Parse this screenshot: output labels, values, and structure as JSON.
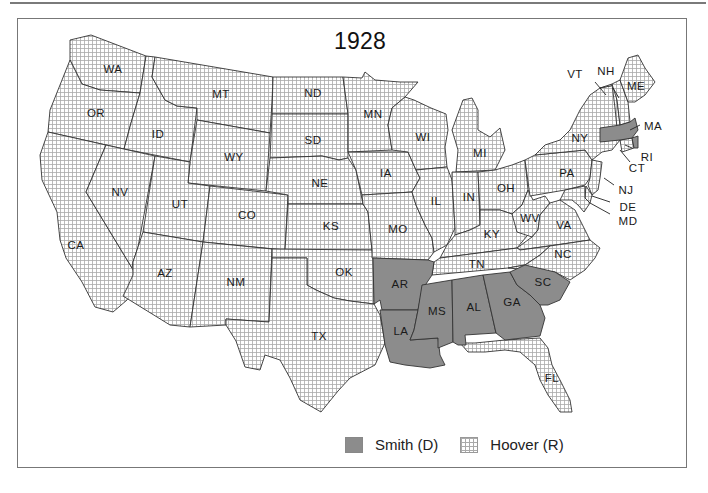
{
  "title": "1928",
  "colors": {
    "smith_fill": "#8c8c8c",
    "hoover_grid": "#a9a9a9",
    "border": "#333333",
    "frame": "#777777"
  },
  "legend": [
    {
      "key": "smith",
      "label": "Smith (D)",
      "pattern": "solid-gray"
    },
    {
      "key": "hoover",
      "label": "Hoover (R)",
      "pattern": "grid"
    }
  ],
  "states": {
    "smith": [
      "AR",
      "LA",
      "MS",
      "AL",
      "GA",
      "SC",
      "MA",
      "RI"
    ],
    "hoover": [
      "WA",
      "OR",
      "CA",
      "ID",
      "NV",
      "MT",
      "WY",
      "UT",
      "AZ",
      "CO",
      "NM",
      "ND",
      "SD",
      "NE",
      "KS",
      "OK",
      "TX",
      "MN",
      "IA",
      "MO",
      "WI",
      "IL",
      "MI",
      "IN",
      "OH",
      "KY",
      "TN",
      "WV",
      "VA",
      "NC",
      "FL",
      "PA",
      "NY",
      "VT",
      "NH",
      "ME",
      "CT",
      "NJ",
      "DE",
      "MD"
    ]
  },
  "labels": {
    "WA": "WA",
    "OR": "OR",
    "CA": "CA",
    "ID": "ID",
    "NV": "NV",
    "MT": "MT",
    "WY": "WY",
    "UT": "UT",
    "AZ": "AZ",
    "CO": "CO",
    "NM": "NM",
    "ND": "ND",
    "SD": "SD",
    "NE": "NE",
    "KS": "KS",
    "OK": "OK",
    "TX": "TX",
    "MN": "MN",
    "IA": "IA",
    "MO": "MO",
    "AR": "AR",
    "LA": "LA",
    "WI": "WI",
    "IL": "IL",
    "MI": "MI",
    "IN": "IN",
    "OH": "OH",
    "KY": "KY",
    "TN": "TN",
    "MS": "MS",
    "AL": "AL",
    "GA": "GA",
    "FL": "FL",
    "SC": "SC",
    "NC": "NC",
    "VA": "VA",
    "WV": "WV",
    "PA": "PA",
    "NY": "NY",
    "VT": "VT",
    "NH": "NH",
    "ME": "ME",
    "MA": "MA",
    "RI": "RI",
    "CT": "CT",
    "NJ": "NJ",
    "DE": "DE",
    "MD": "MD"
  }
}
